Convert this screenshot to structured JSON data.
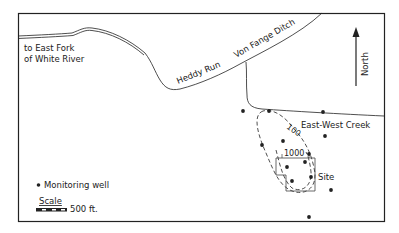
{
  "map": {
    "labels": {
      "river_to": "to East Fork",
      "river_to_2": "of White River",
      "heddy_run": "Heddy Run",
      "von_fange": "Von Fange Ditch",
      "east_west_creek": "East-West Creek",
      "north": "North",
      "site": "Site",
      "contour_100": "100",
      "contour_1000": "1000"
    },
    "legend": {
      "well_label": "Monitoring well",
      "scale_label": "Scale",
      "scale_value": "500 ft."
    },
    "wells": [
      {
        "x": 243,
        "y": 111
      },
      {
        "x": 269,
        "y": 111
      },
      {
        "x": 323,
        "y": 112
      },
      {
        "x": 325,
        "y": 136
      },
      {
        "x": 262,
        "y": 145
      },
      {
        "x": 283,
        "y": 141
      },
      {
        "x": 309,
        "y": 154
      },
      {
        "x": 305,
        "y": 162
      },
      {
        "x": 287,
        "y": 167
      },
      {
        "x": 292,
        "y": 181
      },
      {
        "x": 311,
        "y": 177
      },
      {
        "x": 331,
        "y": 190
      },
      {
        "x": 309,
        "y": 217
      }
    ],
    "colors": {
      "ink": "#222222",
      "background": "#ffffff"
    }
  }
}
